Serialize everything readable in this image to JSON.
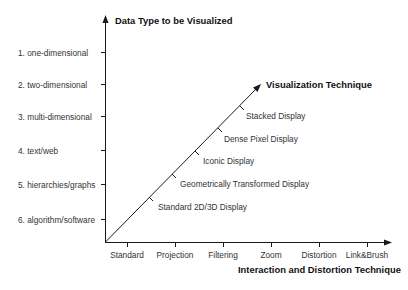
{
  "diagram": {
    "y_axis": {
      "title": "Data Type to be Visualized",
      "labels": [
        "1. one-dimensional",
        "2. two-dimensional",
        "3. multi-dimensional",
        "4. text/web",
        "5. hierarchies/graphs",
        "6. algorithm/software"
      ]
    },
    "x_axis": {
      "title": "Interaction and Distortion Technique",
      "labels": [
        "Standard",
        "Projection",
        "Filtering",
        "Zoom",
        "Distortion",
        "Link&Brush"
      ]
    },
    "diagonal_axis": {
      "title": "Visualization Technique",
      "labels": [
        "Standard 2D/3D Display",
        "Geometrically Transformed Display",
        "Iconic Display",
        "Dense Pixel Display",
        "Stacked Display"
      ]
    },
    "colors": {
      "line": "#1a1a1a",
      "text": "#333333",
      "background": "#ffffff"
    }
  }
}
